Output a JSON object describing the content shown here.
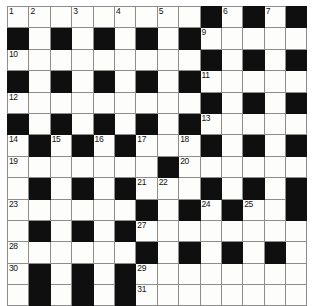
{
  "puzzle": {
    "title": "Crossword Grid",
    "type": "crossword",
    "columns": 14,
    "rows": 14,
    "colors": {
      "block": "#100f0f",
      "cell": "#fdfdfb",
      "grid_line": "#8d8d8d",
      "border": "#4a4a4a",
      "number_text": "#111111"
    },
    "legend": {
      "white_cell": "0",
      "black_cell": "1"
    },
    "grid": [
      [
        0,
        0,
        0,
        0,
        0,
        0,
        0,
        0,
        0,
        1,
        0,
        1,
        0,
        1
      ],
      [
        1,
        0,
        1,
        0,
        1,
        0,
        1,
        0,
        1,
        0,
        0,
        0,
        0,
        0
      ],
      [
        0,
        0,
        0,
        0,
        0,
        0,
        0,
        0,
        0,
        1,
        0,
        1,
        0,
        1
      ],
      [
        1,
        0,
        1,
        0,
        1,
        0,
        1,
        0,
        1,
        0,
        0,
        0,
        0,
        0
      ],
      [
        0,
        0,
        0,
        0,
        0,
        0,
        0,
        0,
        0,
        1,
        0,
        1,
        0,
        1
      ],
      [
        1,
        0,
        1,
        0,
        1,
        0,
        1,
        0,
        1,
        0,
        0,
        0,
        0,
        0
      ],
      [
        0,
        1,
        0,
        1,
        0,
        1,
        0,
        0,
        0,
        1,
        0,
        1,
        0,
        1
      ],
      [
        0,
        0,
        0,
        0,
        0,
        0,
        0,
        1,
        0,
        0,
        0,
        0,
        0,
        0
      ],
      [
        0,
        1,
        0,
        1,
        0,
        1,
        0,
        0,
        0,
        1,
        0,
        1,
        0,
        1
      ],
      [
        0,
        0,
        0,
        0,
        0,
        0,
        1,
        0,
        1,
        0,
        1,
        0,
        0,
        1
      ],
      [
        0,
        1,
        0,
        1,
        0,
        1,
        0,
        0,
        0,
        0,
        0,
        0,
        0,
        0
      ],
      [
        0,
        0,
        0,
        0,
        0,
        0,
        1,
        0,
        1,
        0,
        1,
        0,
        1,
        0
      ],
      [
        0,
        1,
        0,
        1,
        0,
        1,
        0,
        0,
        0,
        0,
        0,
        0,
        0,
        0
      ],
      [
        0,
        1,
        0,
        1,
        0,
        1,
        0,
        0,
        0,
        0,
        0,
        0,
        0,
        0
      ]
    ],
    "numbers": [
      {
        "row": 0,
        "col": 0,
        "label": "1"
      },
      {
        "row": 0,
        "col": 1,
        "label": "2"
      },
      {
        "row": 0,
        "col": 3,
        "label": "3"
      },
      {
        "row": 0,
        "col": 5,
        "label": "4"
      },
      {
        "row": 0,
        "col": 7,
        "label": "5"
      },
      {
        "row": 0,
        "col": 10,
        "label": "6"
      },
      {
        "row": 0,
        "col": 12,
        "label": "7"
      },
      {
        "row": 1,
        "col": 9,
        "label": "9"
      },
      {
        "row": 0,
        "col": 13,
        "label": "8"
      },
      {
        "row": 2,
        "col": 0,
        "label": "10"
      },
      {
        "row": 3,
        "col": 9,
        "label": "11"
      },
      {
        "row": 4,
        "col": 0,
        "label": "12"
      },
      {
        "row": 5,
        "col": 9,
        "label": "13"
      },
      {
        "row": 6,
        "col": 0,
        "label": "14"
      },
      {
        "row": 6,
        "col": 2,
        "label": "15"
      },
      {
        "row": 6,
        "col": 4,
        "label": "16"
      },
      {
        "row": 6,
        "col": 6,
        "label": "17"
      },
      {
        "row": 6,
        "col": 8,
        "label": "18"
      },
      {
        "row": 7,
        "col": 0,
        "label": "19"
      },
      {
        "row": 7,
        "col": 8,
        "label": "20"
      },
      {
        "row": 8,
        "col": 6,
        "label": "21"
      },
      {
        "row": 8,
        "col": 7,
        "label": "22"
      },
      {
        "row": 9,
        "col": 0,
        "label": "23"
      },
      {
        "row": 9,
        "col": 9,
        "label": "24"
      },
      {
        "row": 9,
        "col": 11,
        "label": "25"
      },
      {
        "row": 9,
        "col": 13,
        "label": "26"
      },
      {
        "row": 10,
        "col": 6,
        "label": "27"
      },
      {
        "row": 11,
        "col": 0,
        "label": "28"
      },
      {
        "row": 12,
        "col": 6,
        "label": "29"
      },
      {
        "row": 12,
        "col": 0,
        "label": "30"
      },
      {
        "row": 13,
        "col": 6,
        "label": "31"
      }
    ]
  }
}
